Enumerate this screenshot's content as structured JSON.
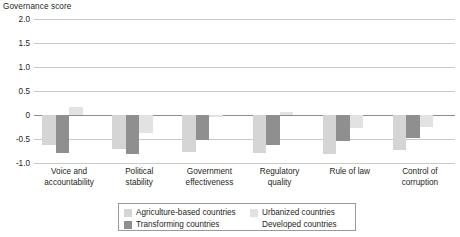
{
  "chart_data": {
    "type": "bar",
    "title": "",
    "ylabel": "Governance score",
    "xlabel": "",
    "ylim": [
      -1.0,
      2.0
    ],
    "yticks": [
      "2.0",
      "1.5",
      "1.0",
      "0.5",
      "0",
      "-0.5",
      "-1.0"
    ],
    "ytick_values": [
      2.0,
      1.5,
      1.0,
      0.5,
      0,
      -0.5,
      -1.0
    ],
    "grid": true,
    "grid_axis": "y",
    "legend_position": "bottom",
    "categories": [
      "Voice and accountability",
      "Political stability",
      "Government effectiveness",
      "Regulatory quality",
      "Rule of law",
      "Control of corruption"
    ],
    "category_lines": [
      [
        "Voice and",
        "accountability"
      ],
      [
        "Political",
        "stability"
      ],
      [
        "Government",
        "effectiveness"
      ],
      [
        "Regulatory",
        "quality"
      ],
      [
        "Rule of law"
      ],
      [
        "Control of",
        "corruption"
      ]
    ],
    "series": [
      {
        "name": "Agriculture-based countries",
        "color": "#d5d5d5",
        "values": [
          -0.62,
          -0.7,
          -0.78,
          -0.8,
          -0.82,
          -0.72
        ]
      },
      {
        "name": "Transforming countries",
        "color": "#8f8f8f",
        "values": [
          -0.8,
          -0.82,
          -0.52,
          -0.62,
          -0.55,
          -0.48
        ]
      },
      {
        "name": "Urbanized countries",
        "color": "#e2e2e2",
        "values": [
          0.16,
          -0.38,
          -0.05,
          0.07,
          -0.28,
          -0.24
        ]
      },
      {
        "name": "Developed countries",
        "color": "#ffffff",
        "values": [
          0.0,
          0.0,
          0.0,
          0.0,
          0.0,
          0.0
        ]
      }
    ]
  },
  "legend": {
    "items": [
      {
        "label": "Agriculture-based countries",
        "swatch": "#d5d5d5"
      },
      {
        "label": "Urbanized countries",
        "swatch": "#e2e2e2"
      },
      {
        "label": "Transforming countries",
        "swatch": "#8f8f8f"
      },
      {
        "label": "Developed countries",
        "swatch": "#ffffff"
      }
    ]
  }
}
